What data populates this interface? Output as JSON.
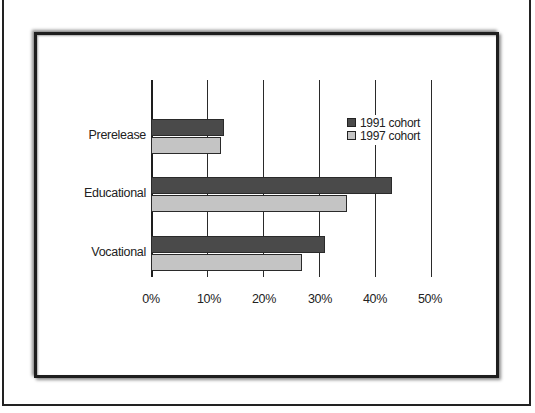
{
  "chart_data": {
    "type": "bar",
    "orientation": "horizontal",
    "title": "",
    "xlabel": "",
    "ylabel": "",
    "categories": [
      "Prerelease",
      "Educational",
      "Vocational"
    ],
    "series": [
      {
        "name": "1991 cohort",
        "color": "#4a4a4a",
        "values": [
          13,
          43,
          31
        ]
      },
      {
        "name": "1997 cohort",
        "color": "#c4c4c4",
        "values": [
          12.5,
          35,
          27
        ]
      }
    ],
    "xlim": [
      0,
      50
    ],
    "x_ticks": [
      "0%",
      "10%",
      "20%",
      "30%",
      "40%",
      "50%"
    ],
    "grid": "vertical",
    "legend_position": "upper right (inside plot)"
  },
  "labels": {
    "categories": [
      "Prerelease",
      "Educational",
      "Vocational"
    ],
    "ticks": [
      "0%",
      "10%",
      "20%",
      "30%",
      "40%",
      "50%"
    ],
    "legend": [
      "1991 cohort",
      "1997 cohort"
    ]
  }
}
